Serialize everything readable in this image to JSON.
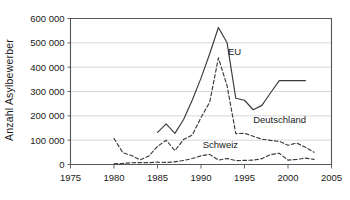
{
  "chart_data": {
    "type": "line",
    "title": "",
    "xlabel": "",
    "ylabel": "Anzahl Asylbewerber",
    "xlim": [
      1975,
      2005
    ],
    "ylim": [
      0,
      600000
    ],
    "xticks": [
      1975,
      1980,
      1985,
      1990,
      1995,
      2000,
      2005
    ],
    "xtick_labels": [
      "1975",
      "1980",
      "1985",
      "1990",
      "1995",
      "2000",
      "2005"
    ],
    "yticks": [
      0,
      100000,
      200000,
      300000,
      400000,
      500000,
      600000
    ],
    "ytick_labels": [
      "0",
      "100 000",
      "200 000",
      "300 000",
      "400 000",
      "500 000",
      "600 000"
    ],
    "grid": "horizontal",
    "legend_position": "inline-annotations",
    "series": [
      {
        "name": "EU",
        "style": "solid",
        "color": "#3a3a3a",
        "label_x": 1993.1,
        "label_y": 452000,
        "x": [
          1985,
          1986,
          1987,
          1988,
          1989,
          1990,
          1991,
          1992,
          1993,
          1994,
          1995,
          1996,
          1997,
          1998,
          1999,
          2000,
          2001,
          2002
        ],
        "values": [
          132000,
          167000,
          128000,
          185000,
          265000,
          355000,
          455000,
          563000,
          500000,
          272000,
          264000,
          225000,
          243000,
          295000,
          345000,
          345000,
          345000,
          345000
        ]
      },
      {
        "name": "Deutschland",
        "style": "dashed",
        "color": "#3a3a3a",
        "label_x": 1996.0,
        "label_y": 172000,
        "x": [
          1980,
          1981,
          1982,
          1983,
          1984,
          1985,
          1986,
          1987,
          1988,
          1989,
          1990,
          1991,
          1992,
          1993,
          1994,
          1995,
          1996,
          1997,
          1998,
          1999,
          2000,
          2001,
          2002,
          2003
        ],
        "values": [
          107000,
          49000,
          37000,
          19000,
          35000,
          74000,
          100000,
          57000,
          103000,
          121000,
          193000,
          256000,
          438000,
          323000,
          127000,
          128000,
          116000,
          104000,
          99000,
          95000,
          79000,
          88000,
          71000,
          50000
        ]
      },
      {
        "name": "Schweiz",
        "style": "dashed",
        "color": "#3a3a3a",
        "label_x": 1990.2,
        "label_y": 68000,
        "x": [
          1980,
          1981,
          1982,
          1983,
          1984,
          1985,
          1986,
          1987,
          1988,
          1989,
          1990,
          1991,
          1992,
          1993,
          1994,
          1995,
          1996,
          1997,
          1998,
          1999,
          2000,
          2001,
          2002,
          2003
        ],
        "values": [
          3000,
          4500,
          7000,
          7900,
          7400,
          9700,
          8500,
          10900,
          16700,
          24400,
          35800,
          41600,
          18000,
          24700,
          16100,
          17000,
          18000,
          24000,
          41000,
          46000,
          18000,
          21000,
          26000,
          21000
        ]
      }
    ]
  },
  "annotations": {
    "eu": "EU",
    "deutschland": "Deutschland",
    "schweiz": "Schweiz"
  },
  "colors": {
    "axis": "#555555",
    "grid": "#cfcfcf",
    "line": "#3a3a3a",
    "text": "#1a1a1a",
    "background": "#ffffff"
  }
}
